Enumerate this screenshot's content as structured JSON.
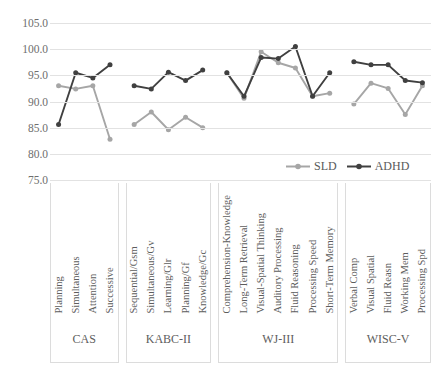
{
  "chart_data": {
    "type": "line",
    "title": "",
    "xlabel": "",
    "ylabel": "",
    "ylim": [
      75.0,
      105.0
    ],
    "ytick_step": 5,
    "ytick_labels": [
      "105.0",
      "100.0",
      "95.0",
      "90.0",
      "85.0",
      "80.0",
      "75.0"
    ],
    "ytick_values": [
      105.0,
      100.0,
      95.0,
      90.0,
      85.0,
      80.0,
      75.0
    ],
    "grid": true,
    "legend_position": "bottom-right",
    "groups": [
      {
        "name": "CAS",
        "categories": [
          "Planning",
          "Simultaneous",
          "Attention",
          "Successive"
        ],
        "series": [
          {
            "name": "SLD",
            "values": [
              93.0,
              92.4,
              93.0,
              82.8
            ]
          },
          {
            "name": "ADHD",
            "values": [
              85.6,
              95.5,
              94.5,
              97.0
            ]
          }
        ]
      },
      {
        "name": "KABC-II",
        "categories": [
          "Sequential/Gsm",
          "Simultaneous/Gv",
          "Learning/Glr",
          "Planning/Gf",
          "Knowledge/Gc"
        ],
        "series": [
          {
            "name": "SLD",
            "values": [
              85.6,
              88.0,
              84.6,
              87.0,
              85.0
            ]
          },
          {
            "name": "ADHD",
            "values": [
              93.0,
              92.4,
              95.6,
              94.0,
              96.0
            ]
          }
        ]
      },
      {
        "name": "WJ-III",
        "categories": [
          "Comprehension-Knowledge",
          "Long-Term Retrieval",
          "Visual-Spatial Thinking",
          "Auditory Processing",
          "Fluid Reasoning",
          "Processing Speed",
          "Short-Term Memory"
        ],
        "series": [
          {
            "name": "SLD",
            "values": [
              95.5,
              90.6,
              99.5,
              97.4,
              96.4,
              91.0,
              91.6
            ]
          },
          {
            "name": "ADHD",
            "values": [
              95.5,
              91.0,
              98.4,
              98.2,
              100.5,
              91.0,
              95.5
            ]
          }
        ]
      },
      {
        "name": "WISC-V",
        "categories": [
          "Verbal Comp",
          "Visual Spatial",
          "Fluid Reasn",
          "Working Mem",
          "Processing Spd"
        ],
        "series": [
          {
            "name": "SLD",
            "values": [
              89.5,
              93.5,
              92.5,
              87.5,
              93.0
            ]
          },
          {
            "name": "ADHD",
            "values": [
              97.6,
              97.0,
              97.0,
              94.0,
              93.6
            ]
          }
        ]
      }
    ],
    "series_styles": [
      {
        "name": "SLD",
        "color": "#A6A6A6"
      },
      {
        "name": "ADHD",
        "color": "#404040"
      }
    ]
  },
  "legend": {
    "items": [
      {
        "label": "SLD",
        "color": "#A6A6A6"
      },
      {
        "label": "ADHD",
        "color": "#404040"
      }
    ]
  }
}
